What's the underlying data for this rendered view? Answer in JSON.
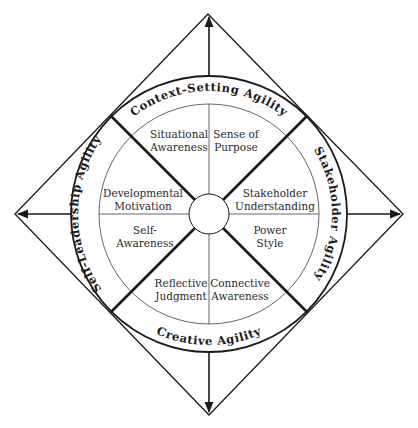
{
  "diagram": {
    "type": "leadership-agility-compass",
    "outer_ring": {
      "top": "Context-Setting Agility",
      "right": "Stakeholder Agility",
      "bottom": "Creative Agility",
      "left": "Self-Leadership Agility"
    },
    "segments": {
      "top_left": {
        "line1": "Situational",
        "line2": "Awareness"
      },
      "top_right": {
        "line1": "Sense of",
        "line2": "Purpose"
      },
      "right_upper": {
        "line1": "Stakeholder",
        "line2": "Understanding"
      },
      "right_lower": {
        "line1": "Power",
        "line2": "Style"
      },
      "bottom_right": {
        "line1": "Connective",
        "line2": "Awareness"
      },
      "bottom_left": {
        "line1": "Reflective",
        "line2": "Judgment"
      },
      "left_lower": {
        "line1": "Self-",
        "line2": "Awareness"
      },
      "left_upper": {
        "line1": "Developmental",
        "line2": "Motivation"
      }
    },
    "colors": {
      "stroke": "#1a1a1a",
      "thin_stroke": "#555555",
      "background": "#ffffff"
    }
  }
}
